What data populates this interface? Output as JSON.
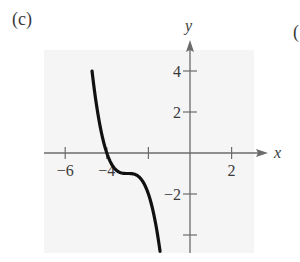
{
  "panel": {
    "label": "(c)",
    "next_label": "("
  },
  "colors": {
    "background": "#f5f5f5",
    "axis": "#6b6b6b",
    "curve": "#111111",
    "text": "#3a3a3a"
  },
  "chart_data": {
    "type": "line",
    "title": "",
    "panel_label": "(c)",
    "xlabel": "x",
    "ylabel": "y",
    "xlim": [
      -7,
      3.5
    ],
    "ylim": [
      -4.9,
      5.5
    ],
    "grid": false,
    "legend": null,
    "x_ticks": [
      -6,
      -4,
      -2,
      2
    ],
    "x_tick_labels": [
      "−6",
      "−4",
      "",
      "2"
    ],
    "y_ticks": [
      4,
      2,
      -2,
      -4
    ],
    "y_tick_labels": [
      "4",
      "2",
      "−2",
      ""
    ],
    "series": [
      {
        "name": "curve",
        "function": "y = -(x+3)^3 - 1",
        "x": [
          -4.71,
          -4.5,
          -4.25,
          -4.0,
          -3.75,
          -3.5,
          -3.25,
          -3.0,
          -2.75,
          -2.5,
          -2.25,
          -2.0,
          -1.75,
          -1.5,
          -1.44
        ],
        "y": [
          4.0,
          2.38,
          0.95,
          0.0,
          -0.58,
          -0.88,
          -0.98,
          -1.0,
          -1.02,
          -1.13,
          -1.42,
          -2.0,
          -2.95,
          -4.38,
          -4.8
        ]
      }
    ],
    "annotations": []
  }
}
